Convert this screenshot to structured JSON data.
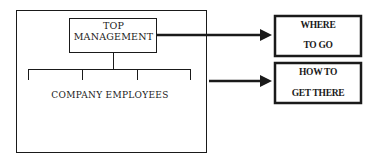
{
  "diagram": {
    "organization": {
      "top_box": {
        "line1": "TOP",
        "line2": "MANAGEMENT"
      },
      "employees_label": "COMPANY EMPLOYEES",
      "branch_count": 4
    },
    "outputs": [
      {
        "line1": "WHERE",
        "line2": "TO GO"
      },
      {
        "line1": "HOW TO",
        "line2": "GET THERE"
      }
    ],
    "colors": {
      "line": "#1a1a1a",
      "background": "#ffffff"
    }
  }
}
